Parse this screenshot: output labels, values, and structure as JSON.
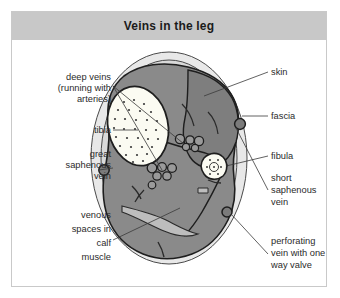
{
  "figure": {
    "title": "Veins in the leg",
    "caption_bar_color": "#c8c8c8",
    "border_color": "#c9c9c9"
  },
  "colors": {
    "skin_fill": "#e8e8e8",
    "fascia_fill": "#d9d9d9",
    "muscle_fill": "#8a8a8a",
    "muscle_dark": "#6e6e6e",
    "bone_fill": "#fbfbf2",
    "bone_stipple": "#3a3a3a",
    "vein_fill": "#7b7b7b",
    "outline": "#262626",
    "text": "#2b2b2b"
  },
  "labels": {
    "deep_veins": {
      "lines": [
        "deep veins",
        "(running with",
        "arteries)"
      ],
      "side": "left",
      "anchor_x": 99,
      "anchor_y": 48
    },
    "tibia": {
      "lines": [
        "tibia"
      ],
      "side": "left",
      "anchor_x": 99,
      "anchor_y": 92
    },
    "great_saphenous_vein": {
      "lines": [
        "great",
        "saphenous",
        "vein"
      ],
      "side": "left",
      "anchor_x": 99,
      "anchor_y": 152
    },
    "venous_spaces": {
      "lines": [
        "venous",
        "spaces in",
        "calf",
        "muscle"
      ],
      "side": "left",
      "anchor_x": 99,
      "anchor_y": 204
    },
    "skin": {
      "lines": [
        "skin"
      ],
      "side": "right",
      "anchor_x": 258,
      "anchor_y": 32
    },
    "fascia": {
      "lines": [
        "fascia"
      ],
      "side": "right",
      "anchor_x": 258,
      "anchor_y": 76
    },
    "fibula": {
      "lines": [
        "fibula"
      ],
      "side": "right",
      "anchor_x": 258,
      "anchor_y": 116
    },
    "short_saphenous_vein": {
      "lines": [
        "short",
        "saphenous",
        "vein"
      ],
      "side": "right",
      "anchor_x": 258,
      "anchor_y": 152
    },
    "perforating_vein": {
      "lines": [
        "perforating",
        "vein with one",
        "way valve"
      ],
      "side": "right",
      "anchor_x": 258,
      "anchor_y": 214
    }
  },
  "structures": {
    "skin_label": "skin",
    "fascia_label": "fascia",
    "tibia_label": "tibia",
    "fibula_label": "fibula",
    "muscle_label": "calf muscle compartment",
    "great_saphenous_marker": "great-saphenous-vein-marker",
    "short_saphenous_marker": "short-saphenous-vein-marker",
    "perforating_marker": "perforating-vein-marker",
    "deep_vein_cluster": "deep-vein-cluster"
  }
}
